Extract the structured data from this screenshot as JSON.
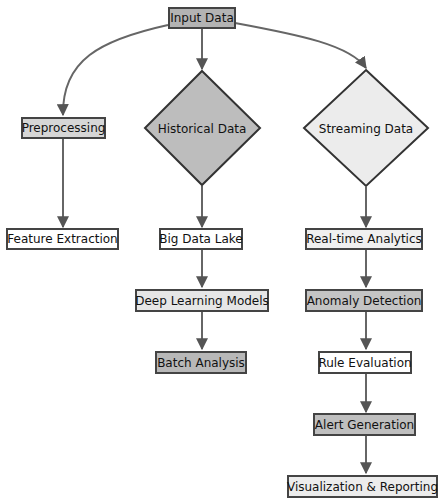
{
  "diagram": {
    "type": "flowchart",
    "nodes": {
      "input": {
        "label": "Input Data",
        "shape": "rect",
        "fill": "#b3b3b3"
      },
      "preprocessing": {
        "label": "Preprocessing",
        "shape": "rect",
        "fill": "#d6d6d6"
      },
      "feature_extraction": {
        "label": "Feature Extraction",
        "shape": "rect",
        "fill": "#ffffff"
      },
      "historical": {
        "label": "Historical Data",
        "shape": "diamond",
        "fill": "#bdbdbd"
      },
      "streaming": {
        "label": "Streaming Data",
        "shape": "diamond",
        "fill": "#ececec"
      },
      "big_data_lake": {
        "label": "Big Data Lake",
        "shape": "rect",
        "fill": "#ffffff"
      },
      "deep_learning": {
        "label": "Deep Learning Models",
        "shape": "rect",
        "fill": "#e6e6e6"
      },
      "batch_analysis": {
        "label": "Batch Analysis",
        "shape": "rect",
        "fill": "#b8b8b8"
      },
      "realtime": {
        "label": "Real-time Analytics",
        "shape": "rect",
        "fill": "#f0f0f0"
      },
      "anomaly": {
        "label": "Anomaly Detection",
        "shape": "rect",
        "fill": "#c4c4c4"
      },
      "rule_eval": {
        "label": "Rule Evaluation",
        "shape": "rect",
        "fill": "#ffffff"
      },
      "alert": {
        "label": "Alert Generation",
        "shape": "rect",
        "fill": "#bfbfbf"
      },
      "visualization": {
        "label": "Visualization & Reporting",
        "shape": "rect",
        "fill": "#ececec"
      }
    },
    "edges": [
      [
        "input",
        "preprocessing"
      ],
      [
        "input",
        "historical"
      ],
      [
        "input",
        "streaming"
      ],
      [
        "preprocessing",
        "feature_extraction"
      ],
      [
        "historical",
        "big_data_lake"
      ],
      [
        "big_data_lake",
        "deep_learning"
      ],
      [
        "deep_learning",
        "batch_analysis"
      ],
      [
        "streaming",
        "realtime"
      ],
      [
        "realtime",
        "anomaly"
      ],
      [
        "anomaly",
        "rule_eval"
      ],
      [
        "rule_eval",
        "alert"
      ],
      [
        "alert",
        "visualization"
      ]
    ]
  }
}
